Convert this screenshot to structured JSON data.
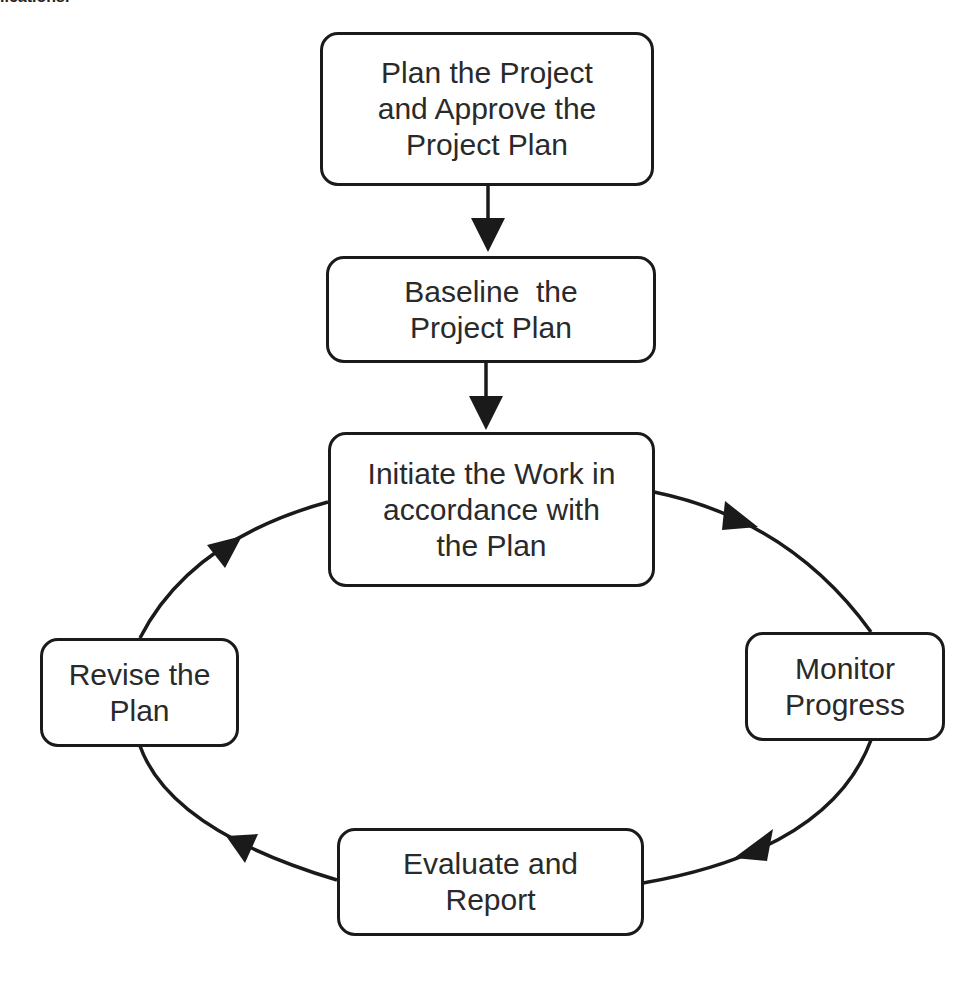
{
  "caption_fragment": "lications.",
  "diagram": {
    "type": "process-cycle",
    "colors": {
      "line": "#1a1a1a",
      "text": "#2a2a2a",
      "background": "#ffffff"
    },
    "nodes": [
      {
        "id": "plan",
        "lines": [
          "Plan the Project",
          "and Approve the",
          "Project Plan"
        ]
      },
      {
        "id": "baseline",
        "lines": [
          "Baseline  the",
          "Project Plan"
        ]
      },
      {
        "id": "initiate",
        "lines": [
          "Initiate the Work in",
          "accordance with",
          "the Plan"
        ]
      },
      {
        "id": "monitor",
        "lines": [
          "Monitor",
          "Progress"
        ]
      },
      {
        "id": "evaluate",
        "lines": [
          "Evaluate and",
          "Report"
        ]
      },
      {
        "id": "revise",
        "lines": [
          "Revise the",
          "Plan"
        ]
      }
    ],
    "edges": [
      {
        "from": "plan",
        "to": "baseline"
      },
      {
        "from": "baseline",
        "to": "initiate"
      },
      {
        "from": "initiate",
        "to": "monitor"
      },
      {
        "from": "monitor",
        "to": "evaluate"
      },
      {
        "from": "evaluate",
        "to": "revise"
      },
      {
        "from": "revise",
        "to": "initiate"
      }
    ]
  }
}
